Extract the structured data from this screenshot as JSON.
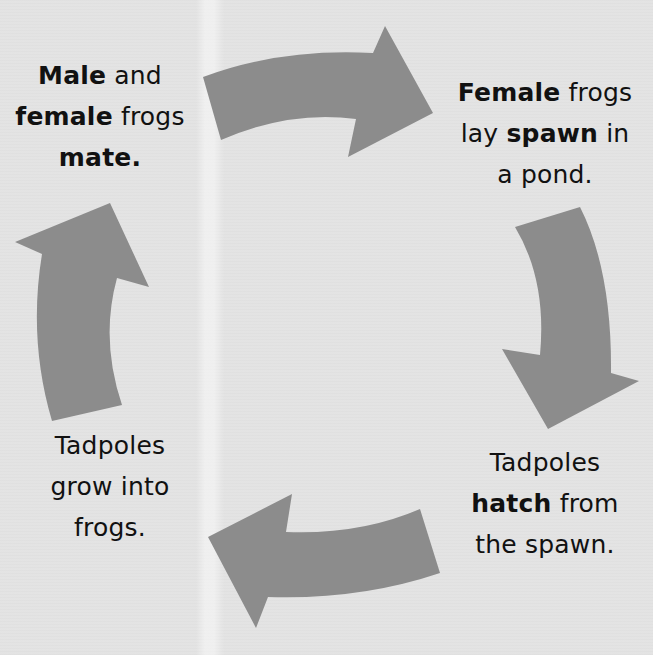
{
  "diagram": {
    "type": "cycle",
    "colors": {
      "background": "#e3e3e3",
      "arrow": "#8c8c8c",
      "text": "#111111"
    },
    "steps": [
      {
        "id": "step1",
        "position": "top-left",
        "lines": [
          [
            {
              "text": "Male",
              "bold": true
            },
            {
              "text": " and",
              "bold": false
            }
          ],
          [
            {
              "text": "female",
              "bold": true
            },
            {
              "text": " frogs",
              "bold": false
            }
          ],
          [
            {
              "text": "mate.",
              "bold": true
            }
          ]
        ]
      },
      {
        "id": "step2",
        "position": "top-right",
        "lines": [
          [
            {
              "text": "Female",
              "bold": true
            },
            {
              "text": " frogs",
              "bold": false
            }
          ],
          [
            {
              "text": "lay ",
              "bold": false
            },
            {
              "text": "spawn",
              "bold": true
            },
            {
              "text": " in",
              "bold": false
            }
          ],
          [
            {
              "text": "a pond.",
              "bold": false
            }
          ]
        ]
      },
      {
        "id": "step3",
        "position": "bottom-right",
        "lines": [
          [
            {
              "text": "Tadpoles",
              "bold": false
            }
          ],
          [
            {
              "text": "hatch",
              "bold": true
            },
            {
              "text": " from",
              "bold": false
            }
          ],
          [
            {
              "text": "the spawn.",
              "bold": false
            }
          ]
        ]
      },
      {
        "id": "step4",
        "position": "bottom-left",
        "lines": [
          [
            {
              "text": "Tadpoles",
              "bold": false
            }
          ],
          [
            {
              "text": "grow into",
              "bold": false
            }
          ],
          [
            {
              "text": "frogs.",
              "bold": false
            }
          ]
        ]
      }
    ],
    "arrows": [
      {
        "name": "arrow-step1-to-step2",
        "direction": "right"
      },
      {
        "name": "arrow-step2-to-step3",
        "direction": "down"
      },
      {
        "name": "arrow-step3-to-step4",
        "direction": "left"
      },
      {
        "name": "arrow-step4-to-step1",
        "direction": "up"
      }
    ]
  }
}
